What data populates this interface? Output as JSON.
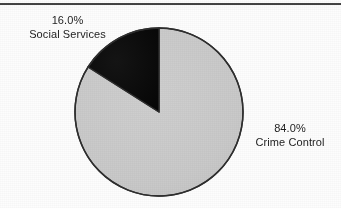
{
  "figure": {
    "background_color": "#fdfdfd",
    "rule_color": "#2b2b2b"
  },
  "chart_data": {
    "type": "pie",
    "title": "",
    "subtitle": "",
    "xlabel": "",
    "ylabel": "",
    "legend_position": "none",
    "grid": false,
    "start_angle_deg": 90,
    "direction": "counterclockwise",
    "categories": [
      "Social Services",
      "Crime Control"
    ],
    "values": [
      16.0,
      84.0
    ],
    "value_unit": "percent",
    "slices": [
      {
        "label": "Social Services",
        "percent_text": "16.0%",
        "value": 16.0,
        "color": "#0d0d0d",
        "label_position": "upper-left"
      },
      {
        "label": "Crime Control",
        "percent_text": "84.0%",
        "value": 84.0,
        "color": "#c9c9c9",
        "label_position": "right"
      }
    ],
    "annotations": [
      {
        "text": "16.0%"
      },
      {
        "text": "Social Services"
      },
      {
        "text": "84.0%"
      },
      {
        "text": "Crime Control"
      }
    ]
  },
  "labels": {
    "social": {
      "percent": "16.0%",
      "name": "Social Services"
    },
    "crime": {
      "percent": "84.0%",
      "name": "Crime Control"
    }
  }
}
